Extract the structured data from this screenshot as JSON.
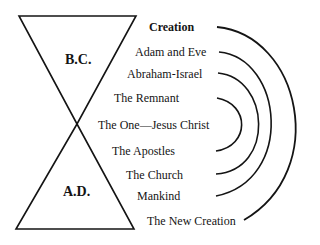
{
  "diagram": {
    "eras": {
      "bc": "B.C.",
      "ad": "A.D."
    },
    "labels": [
      {
        "text": "Creation",
        "bold": true
      },
      {
        "text": "Adam and Eve",
        "bold": false
      },
      {
        "text": "Abraham-Israel",
        "bold": false
      },
      {
        "text": "The Remnant",
        "bold": false
      },
      {
        "text": "The One—Jesus Christ",
        "bold": false
      },
      {
        "text": "The Apostles",
        "bold": false
      },
      {
        "text": "The Church",
        "bold": false
      },
      {
        "text": "Mankind",
        "bold": false
      },
      {
        "text": "The New Creation",
        "bold": false
      }
    ],
    "arcs": [
      {
        "from": "Creation",
        "to": "The New Creation"
      },
      {
        "from": "Adam and Eve",
        "to": "Mankind"
      },
      {
        "from": "Abraham-Israel",
        "to": "The Church"
      },
      {
        "from": "The Remnant",
        "to": "The Apostles"
      }
    ],
    "colors": {
      "ink": "#141414",
      "background": "#ffffff"
    }
  }
}
